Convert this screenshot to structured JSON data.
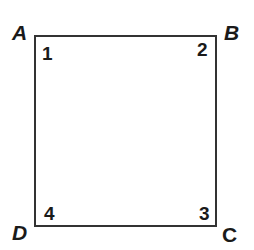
{
  "figure": {
    "shape": "square",
    "vertices": [
      {
        "label": "A",
        "position": "top-left"
      },
      {
        "label": "B",
        "position": "top-right"
      },
      {
        "label": "C",
        "position": "bottom-right"
      },
      {
        "label": "D",
        "position": "bottom-left"
      }
    ],
    "angles": [
      {
        "label": "1",
        "vertex": "A"
      },
      {
        "label": "2",
        "vertex": "B"
      },
      {
        "label": "3",
        "vertex": "C"
      },
      {
        "label": "4",
        "vertex": "D"
      }
    ],
    "line_color": "#333333"
  }
}
